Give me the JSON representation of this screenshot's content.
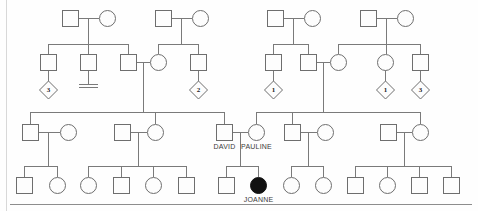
{
  "figure": {
    "width": 478,
    "height": 211,
    "background_color": "#fefefe",
    "line_color": "#7a7a7a",
    "shape_fill": "#fdfdfd",
    "shape_stroke": "#6e6e6e",
    "affected_fill": "#111111",
    "label_color": "#3b3b3b"
  },
  "legend_text": {
    "square": "male",
    "circle": "female",
    "diamond": "sibship of unspecified sex",
    "filled": "affected individual",
    "double_bar": "no issue"
  },
  "labels": {
    "david": "DAVID",
    "pauline": "PAULINE",
    "joanne": "JOANNE"
  },
  "diamond_counts": {
    "d1": "3",
    "d2": "2",
    "d3": "1",
    "d4": "1",
    "d5": "3"
  },
  "chart_data": {
    "type": "diagram",
    "generations": 4,
    "individuals": [
      {
        "id": "I1",
        "gen": 1,
        "sex": "male",
        "affected": false,
        "x": 70,
        "y": 18,
        "label": ""
      },
      {
        "id": "I2",
        "gen": 1,
        "sex": "female",
        "affected": false,
        "x": 107,
        "y": 18,
        "label": ""
      },
      {
        "id": "I3",
        "gen": 1,
        "sex": "male",
        "affected": false,
        "x": 163,
        "y": 18,
        "label": ""
      },
      {
        "id": "I4",
        "gen": 1,
        "sex": "female",
        "affected": false,
        "x": 200,
        "y": 18,
        "label": ""
      },
      {
        "id": "I5",
        "gen": 1,
        "sex": "male",
        "affected": false,
        "x": 275,
        "y": 18,
        "label": ""
      },
      {
        "id": "I6",
        "gen": 1,
        "sex": "female",
        "affected": false,
        "x": 312,
        "y": 18,
        "label": ""
      },
      {
        "id": "I7",
        "gen": 1,
        "sex": "male",
        "affected": false,
        "x": 368,
        "y": 18,
        "label": ""
      },
      {
        "id": "I8",
        "gen": 1,
        "sex": "female",
        "affected": false,
        "x": 405,
        "y": 18,
        "label": ""
      },
      {
        "id": "II1",
        "gen": 2,
        "sex": "male",
        "affected": false,
        "x": 48,
        "y": 62,
        "label": ""
      },
      {
        "id": "II2",
        "gen": 2,
        "sex": "male",
        "affected": false,
        "x": 88,
        "y": 62,
        "label": ""
      },
      {
        "id": "II3",
        "gen": 2,
        "sex": "male",
        "affected": false,
        "x": 128,
        "y": 62,
        "label": ""
      },
      {
        "id": "II4",
        "gen": 2,
        "sex": "female",
        "affected": false,
        "x": 158,
        "y": 62,
        "label": ""
      },
      {
        "id": "II5",
        "gen": 2,
        "sex": "male",
        "affected": false,
        "x": 198,
        "y": 62,
        "label": ""
      },
      {
        "id": "II6",
        "gen": 2,
        "sex": "male",
        "affected": false,
        "x": 273,
        "y": 62,
        "label": ""
      },
      {
        "id": "II7",
        "gen": 2,
        "sex": "male",
        "affected": false,
        "x": 308,
        "y": 62,
        "label": ""
      },
      {
        "id": "II8",
        "gen": 2,
        "sex": "female",
        "affected": false,
        "x": 338,
        "y": 62,
        "label": ""
      },
      {
        "id": "II9",
        "gen": 2,
        "sex": "female",
        "affected": false,
        "x": 385,
        "y": 62,
        "label": ""
      },
      {
        "id": "II10",
        "gen": 2,
        "sex": "male",
        "affected": false,
        "x": 420,
        "y": 62,
        "label": ""
      },
      {
        "id": "III1",
        "gen": 3,
        "sex": "male",
        "affected": false,
        "x": 30,
        "y": 132,
        "label": ""
      },
      {
        "id": "III2",
        "gen": 3,
        "sex": "female",
        "affected": false,
        "x": 68,
        "y": 132,
        "label": ""
      },
      {
        "id": "III3",
        "gen": 3,
        "sex": "male",
        "affected": false,
        "x": 122,
        "y": 132,
        "label": ""
      },
      {
        "id": "III4",
        "gen": 3,
        "sex": "female",
        "affected": false,
        "x": 155,
        "y": 132,
        "label": ""
      },
      {
        "id": "III5",
        "gen": 3,
        "sex": "male",
        "affected": false,
        "x": 224,
        "y": 132,
        "label": "DAVID"
      },
      {
        "id": "III6",
        "gen": 3,
        "sex": "female",
        "affected": false,
        "x": 256,
        "y": 132,
        "label": "PAULINE"
      },
      {
        "id": "III7",
        "gen": 3,
        "sex": "male",
        "affected": false,
        "x": 292,
        "y": 132,
        "label": ""
      },
      {
        "id": "III8",
        "gen": 3,
        "sex": "female",
        "affected": false,
        "x": 325,
        "y": 132,
        "label": ""
      },
      {
        "id": "III9",
        "gen": 3,
        "sex": "male",
        "affected": false,
        "x": 388,
        "y": 132,
        "label": ""
      },
      {
        "id": "III10",
        "gen": 3,
        "sex": "female",
        "affected": false,
        "x": 420,
        "y": 132,
        "label": ""
      },
      {
        "id": "IV1",
        "gen": 4,
        "sex": "male",
        "affected": false,
        "x": 24,
        "y": 185,
        "label": ""
      },
      {
        "id": "IV2",
        "gen": 4,
        "sex": "female",
        "affected": false,
        "x": 57,
        "y": 185,
        "label": ""
      },
      {
        "id": "IV3",
        "gen": 4,
        "sex": "female",
        "affected": false,
        "x": 88,
        "y": 185,
        "label": ""
      },
      {
        "id": "IV4",
        "gen": 4,
        "sex": "male",
        "affected": false,
        "x": 121,
        "y": 185,
        "label": ""
      },
      {
        "id": "IV5",
        "gen": 4,
        "sex": "female",
        "affected": false,
        "x": 153,
        "y": 185,
        "label": ""
      },
      {
        "id": "IV6",
        "gen": 4,
        "sex": "male",
        "affected": false,
        "x": 186,
        "y": 185,
        "label": ""
      },
      {
        "id": "IV7",
        "gen": 4,
        "sex": "male",
        "affected": false,
        "x": 226,
        "y": 185,
        "label": ""
      },
      {
        "id": "IV8",
        "gen": 4,
        "sex": "female",
        "affected": true,
        "x": 258,
        "y": 185,
        "label": "JOANNE"
      },
      {
        "id": "IV9",
        "gen": 4,
        "sex": "female",
        "affected": false,
        "x": 291,
        "y": 185,
        "label": ""
      },
      {
        "id": "IV10",
        "gen": 4,
        "sex": "female",
        "affected": false,
        "x": 323,
        "y": 185,
        "label": ""
      },
      {
        "id": "IV11",
        "gen": 4,
        "sex": "male",
        "affected": false,
        "x": 355,
        "y": 185,
        "label": ""
      },
      {
        "id": "IV12",
        "gen": 4,
        "sex": "female",
        "affected": false,
        "x": 387,
        "y": 185,
        "label": ""
      },
      {
        "id": "IV13",
        "gen": 4,
        "sex": "male",
        "affected": false,
        "x": 419,
        "y": 185,
        "label": ""
      },
      {
        "id": "IV14",
        "gen": 4,
        "sex": "male",
        "affected": false,
        "x": 451,
        "y": 185,
        "label": ""
      }
    ],
    "sibship_diamonds": [
      {
        "id": "D1",
        "x": 48,
        "y": 90,
        "count": "3",
        "parent": "II1"
      },
      {
        "id": "D2",
        "x": 198,
        "y": 90,
        "count": "2",
        "parent": "II5"
      },
      {
        "id": "D3",
        "x": 273,
        "y": 90,
        "count": "1",
        "parent": "II6"
      },
      {
        "id": "D4",
        "x": 385,
        "y": 90,
        "count": "1",
        "parent": "II9"
      },
      {
        "id": "D5",
        "x": 420,
        "y": 90,
        "count": "3",
        "parent": "II10"
      }
    ],
    "no_issue_markers": [
      {
        "id": "N1",
        "x": 88,
        "y": 84,
        "parent": "II2"
      }
    ],
    "matings": [
      {
        "partners": [
          "I1",
          "I2"
        ],
        "children": [
          "II1",
          "II2",
          "II3"
        ]
      },
      {
        "partners": [
          "I3",
          "I4"
        ],
        "children": [
          "II4",
          "II5"
        ]
      },
      {
        "partners": [
          "I5",
          "I6"
        ],
        "children": [
          "II6",
          "II7"
        ]
      },
      {
        "partners": [
          "I7",
          "I8"
        ],
        "children": [
          "II8",
          "II9",
          "II10"
        ]
      },
      {
        "partners": [
          "II3",
          "II4"
        ],
        "children": [
          "III1",
          "III4",
          "III5"
        ]
      },
      {
        "partners": [
          "II7",
          "II8"
        ],
        "children": [
          "III6",
          "III7",
          "III10"
        ]
      },
      {
        "partners": [
          "III1",
          "III2"
        ],
        "children": [
          "IV1",
          "IV2"
        ]
      },
      {
        "partners": [
          "III3",
          "III4"
        ],
        "children": [
          "IV3",
          "IV4",
          "IV5",
          "IV6"
        ]
      },
      {
        "partners": [
          "III5",
          "III6"
        ],
        "children": [
          "IV7",
          "IV8"
        ]
      },
      {
        "partners": [
          "III7",
          "III8"
        ],
        "children": [
          "IV9",
          "IV10"
        ]
      },
      {
        "partners": [
          "III9",
          "III10"
        ],
        "children": [
          "IV11",
          "IV12",
          "IV13",
          "IV14"
        ]
      }
    ]
  }
}
